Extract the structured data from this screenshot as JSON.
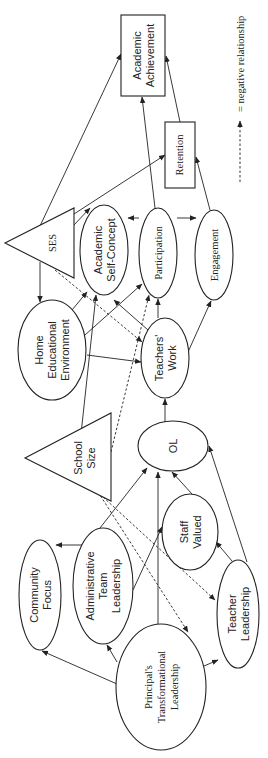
{
  "diagram": {
    "orientation": "rotated 90 degrees counter-clockwise",
    "nodes": {
      "academic_achievement": {
        "label_1": "Academic",
        "label_2": "Achievement",
        "shape": "rectangle"
      },
      "retention": {
        "label_1": "Retention",
        "shape": "rectangle"
      },
      "ses": {
        "label_1": "SES",
        "shape": "triangle"
      },
      "school_size": {
        "label_1": "School",
        "label_2": "Size",
        "shape": "triangle"
      },
      "academic_self_concept": {
        "label_1": "Academic",
        "label_2": "Self-Concept",
        "shape": "ellipse"
      },
      "participation": {
        "label_1": "Participation",
        "shape": "ellipse"
      },
      "engagement": {
        "label_1": "Engagement",
        "shape": "ellipse"
      },
      "home_educational_environment": {
        "label_1": "Home",
        "label_2": "Educational",
        "label_3": "Environment",
        "shape": "ellipse"
      },
      "teachers_work": {
        "label_1": "Teachers'",
        "label_2": "Work",
        "shape": "ellipse"
      },
      "ol": {
        "label_1": "OL",
        "shape": "ellipse"
      },
      "staff_valued": {
        "label_1": "Staff",
        "label_2": "Valued",
        "shape": "ellipse"
      },
      "community_focus": {
        "label_1": "Community",
        "label_2": "Focus",
        "shape": "ellipse"
      },
      "administrative_team_leadership": {
        "label_1": "Administrative",
        "label_2": "Team",
        "label_3": "Leadership",
        "shape": "ellipse"
      },
      "teacher_leadership": {
        "label_1": "Teacher",
        "label_2": "Leadership",
        "shape": "ellipse"
      },
      "principals_transformational_leadership": {
        "label_1": "Principal's",
        "label_2": "Transformational",
        "label_3": "Leadership",
        "shape": "ellipse"
      }
    },
    "edges": [
      {
        "from": "Principal's Transformational Leadership",
        "to": "Community Focus",
        "type": "positive"
      },
      {
        "from": "Principal's Transformational Leadership",
        "to": "Administrative Team Leadership",
        "type": "positive"
      },
      {
        "from": "Principal's Transformational Leadership",
        "to": "Teacher Leadership",
        "type": "positive"
      },
      {
        "from": "Principal's Transformational Leadership",
        "to": "OL",
        "type": "positive"
      },
      {
        "from": "Administrative Team Leadership",
        "to": "Community Focus",
        "type": "positive"
      },
      {
        "from": "Administrative Team Leadership",
        "to": "OL",
        "type": "positive"
      },
      {
        "from": "Administrative Team Leadership",
        "to": "Staff Valued",
        "type": "positive"
      },
      {
        "from": "Teacher Leadership",
        "to": "Staff Valued",
        "type": "positive"
      },
      {
        "from": "Teacher Leadership",
        "to": "OL",
        "type": "positive"
      },
      {
        "from": "Staff Valued",
        "to": "OL",
        "type": "positive"
      },
      {
        "from": "School Size",
        "to": "Principal's Transformational Leadership",
        "type": "negative"
      },
      {
        "from": "School Size",
        "to": "Teacher Leadership",
        "type": "negative"
      },
      {
        "from": "School Size",
        "to": "Participation",
        "type": "negative"
      },
      {
        "from": "School Size",
        "to": "Academic Self-Concept",
        "type": "positive"
      },
      {
        "from": "OL",
        "to": "Teachers' Work",
        "type": "positive"
      },
      {
        "from": "Teachers' Work",
        "to": "Academic Self-Concept",
        "type": "positive"
      },
      {
        "from": "Teachers' Work",
        "to": "Participation",
        "type": "positive"
      },
      {
        "from": "Teachers' Work",
        "to": "Engagement",
        "type": "positive"
      },
      {
        "from": "Home Educational Environment",
        "to": "Academic Self-Concept",
        "type": "positive"
      },
      {
        "from": "Home Educational Environment",
        "to": "Participation",
        "type": "positive"
      },
      {
        "from": "Home Educational Environment",
        "to": "Teachers' Work",
        "type": "positive"
      },
      {
        "from": "SES",
        "to": "Home Educational Environment",
        "type": "positive"
      },
      {
        "from": "SES",
        "to": "Academic Self-Concept",
        "type": "positive"
      },
      {
        "from": "SES",
        "to": "Teachers' Work",
        "type": "negative"
      },
      {
        "from": "SES",
        "to": "Academic Achievement",
        "type": "positive"
      },
      {
        "from": "SES",
        "to": "Retention",
        "type": "positive"
      },
      {
        "from": "Participation",
        "to": "Academic Self-Concept",
        "type": "positive"
      },
      {
        "from": "Participation",
        "to": "Engagement",
        "type": "positive"
      },
      {
        "from": "Participation",
        "to": "Academic Achievement",
        "type": "positive"
      },
      {
        "from": "Engagement",
        "to": "Retention",
        "type": "positive"
      },
      {
        "from": "Retention",
        "to": "Academic Achievement",
        "type": "positive"
      }
    ],
    "legend": {
      "text": "= negative relationship",
      "symbol": "dashed-arrow"
    }
  }
}
